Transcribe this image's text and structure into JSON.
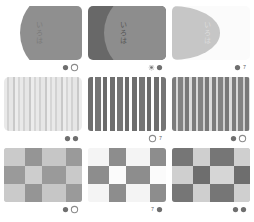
{
  "page": {
    "background": "#ffffff",
    "grid": {
      "rows": 3,
      "columns": 3
    }
  },
  "palette": {
    "light_grey": "#c9c9c9",
    "mid_grey": "#9a9a9a",
    "dark_grey": "#6b6b6b",
    "darker_grey": "#5a5a5a",
    "pale_grey": "#dedede",
    "near_white": "#f2f2f2",
    "white": "#ffffff",
    "caption_grey": "#5d5d5d"
  },
  "tiles": [
    {
      "id": "tile-1",
      "pattern": "circle-lens",
      "row": 1,
      "column": 1,
      "background": "#cfcfcf",
      "shape_color": "#8f8f8f",
      "text": "いろは",
      "text_color": "#7a7a7a",
      "badges": [
        "dot",
        "ring"
      ]
    },
    {
      "id": "tile-2",
      "pattern": "circle-lens",
      "row": 1,
      "column": 2,
      "background": "#686868",
      "shape_color": "#8d8d8d",
      "text": "いろは",
      "text_color": "#555555",
      "badges": [
        "dotring",
        "dot"
      ]
    },
    {
      "id": "tile-3",
      "pattern": "rounded-blob",
      "row": 1,
      "column": 3,
      "background": "#fbfbfb",
      "shape_color": "#c6c6c6",
      "text": "いろは",
      "text_color": "#dcdcdc",
      "badges": [
        "dot",
        "7"
      ]
    },
    {
      "id": "tile-4",
      "pattern": "stripes",
      "row": 2,
      "column": 1,
      "background": "#e9e9e9",
      "contrast": "low",
      "stripe_colors": [
        "#e9e9e9",
        "#cdcdcd"
      ],
      "badges": [
        "dot",
        "dot"
      ]
    },
    {
      "id": "tile-5",
      "pattern": "stripes",
      "row": 2,
      "column": 2,
      "background": "#ffffff",
      "contrast": "high",
      "stripe_colors": [
        "#ffffff",
        "#6e6e6e"
      ],
      "badges": [
        "ring",
        "7"
      ]
    },
    {
      "id": "tile-6",
      "pattern": "stripes",
      "row": 2,
      "column": 3,
      "background": "#d5d5d5",
      "contrast": "medium",
      "stripe_colors": [
        "#d8d8d8",
        "#7c7c7c"
      ],
      "badges": [
        "dot",
        "ring"
      ]
    },
    {
      "id": "tile-7",
      "pattern": "checkerboard",
      "row": 3,
      "column": 1,
      "background": "#cacaca",
      "contrast": "low",
      "check_colors": [
        "#cacaca",
        "#9a9a9a"
      ],
      "badges": [
        "dot",
        "ring"
      ]
    },
    {
      "id": "tile-8",
      "pattern": "checkerboard",
      "row": 3,
      "column": 2,
      "background": "#f4f4f4",
      "contrast": "high",
      "check_colors": [
        "#f4f4f4",
        "#8d8d8d"
      ],
      "badges": [
        "7",
        "dot"
      ]
    },
    {
      "id": "tile-9",
      "pattern": "checkerboard",
      "row": 3,
      "column": 3,
      "background": "#c4c4c4",
      "contrast": "medium",
      "check_colors": [
        "#cfcfcf",
        "#767676"
      ],
      "badges": [
        "dot",
        "dot"
      ]
    }
  ]
}
